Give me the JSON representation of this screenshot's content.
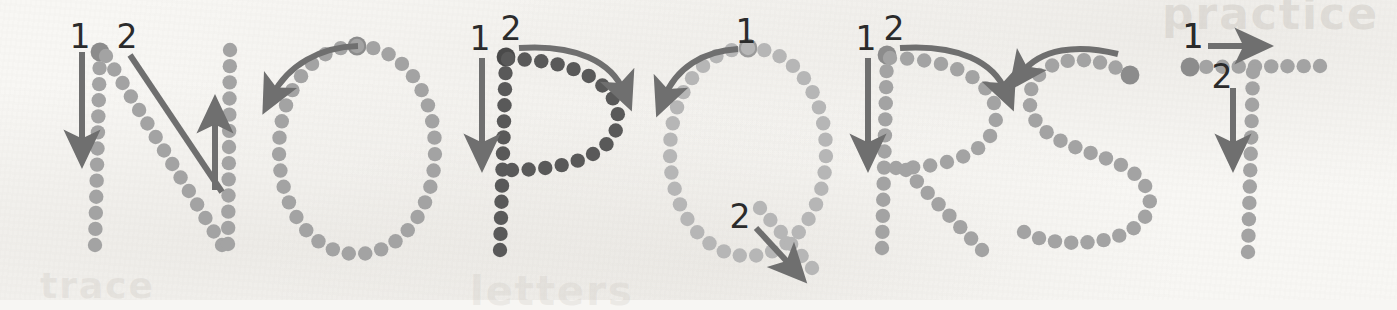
{
  "worksheet": {
    "title": "Uppercase letter formation practice strip",
    "background_color": "#f7f6f3",
    "ghost_text": {
      "top_right": "practice",
      "bottom_left": "trace",
      "bottom_mid": "letters"
    },
    "arrow_color": "#6f6f6f",
    "stroke_number_color": "#2b2b2b"
  },
  "letters": [
    {
      "letter": "N",
      "dot_color": "#a3a3a3",
      "start_dot_color": "#8c8c8c",
      "stroke_count": 2,
      "stroke_numbers": [
        "1",
        "2"
      ],
      "strokes": [
        {
          "number": "1",
          "name": "left-vertical",
          "direction": "down"
        },
        {
          "number": "2",
          "name": "diagonal-then-right-vertical",
          "direction": "down-right-then-up"
        }
      ]
    },
    {
      "letter": "O",
      "dot_color": "#a3a3a3",
      "start_dot_color": "#8c8c8c",
      "stroke_count": 1,
      "stroke_numbers": [],
      "strokes": [
        {
          "number": "",
          "name": "oval",
          "direction": "counter-clockwise"
        }
      ]
    },
    {
      "letter": "P",
      "dot_color": "#595959",
      "start_dot_color": "#4a4a4a",
      "stroke_count": 2,
      "stroke_numbers": [
        "1",
        "2"
      ],
      "strokes": [
        {
          "number": "1",
          "name": "vertical",
          "direction": "down"
        },
        {
          "number": "2",
          "name": "bowl",
          "direction": "clockwise"
        }
      ]
    },
    {
      "letter": "Q",
      "dot_color": "#b6b6b6",
      "start_dot_color": "#9a9a9a",
      "stroke_count": 2,
      "stroke_numbers": [
        "1",
        "2"
      ],
      "strokes": [
        {
          "number": "1",
          "name": "oval",
          "direction": "counter-clockwise"
        },
        {
          "number": "2",
          "name": "tail",
          "direction": "down-right"
        }
      ]
    },
    {
      "letter": "R",
      "dot_color": "#a3a3a3",
      "start_dot_color": "#8c8c8c",
      "stroke_count": 2,
      "stroke_numbers": [
        "1",
        "2"
      ],
      "strokes": [
        {
          "number": "1",
          "name": "vertical",
          "direction": "down"
        },
        {
          "number": "2",
          "name": "bowl-and-leg",
          "direction": "clockwise-then-down-right"
        }
      ]
    },
    {
      "letter": "S",
      "dot_color": "#a3a3a3",
      "start_dot_color": "#8c8c8c",
      "stroke_count": 1,
      "stroke_numbers": [
        "1"
      ],
      "strokes": [
        {
          "number": "1",
          "name": "s-curve",
          "direction": "leftward-then-s"
        }
      ]
    },
    {
      "letter": "T",
      "dot_color": "#a3a3a3",
      "start_dot_color": "#8c8c8c",
      "stroke_count": 2,
      "stroke_numbers": [
        "1",
        "2"
      ],
      "strokes": [
        {
          "number": "1",
          "name": "horizontal-top",
          "direction": "right"
        },
        {
          "number": "2",
          "name": "vertical-stem",
          "direction": "down"
        }
      ]
    }
  ],
  "labels": {
    "n_1": "1",
    "n_2": "2",
    "p_1": "1",
    "p_2": "2",
    "q_1": "1",
    "q_2": "2",
    "r_1": "1",
    "r_2": "2",
    "s_1": "1",
    "t_1": "1",
    "t_2": "2"
  }
}
